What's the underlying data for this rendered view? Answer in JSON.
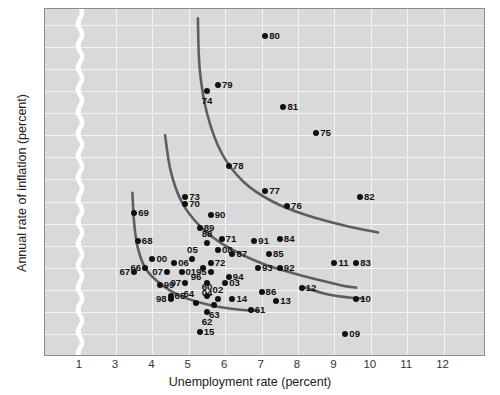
{
  "chart_data": {
    "type": "scatter",
    "title": "",
    "xlabel": "Unemployment rate (percent)",
    "ylabel": "Annual rate of inflation (percent)",
    "xlim": [
      0,
      12.6
    ],
    "ylim": [
      -1,
      14.6
    ],
    "xticks": [
      "1",
      "3",
      "4",
      "5",
      "6",
      "7",
      "8",
      "9",
      "10",
      "11",
      "12"
    ],
    "yticks": [
      "14",
      "13",
      "12",
      "11",
      "10",
      "9",
      "8",
      "7",
      "6",
      "5",
      "4",
      "3",
      "2",
      "1",
      "0",
      "-1"
    ],
    "axis_break": {
      "between": [
        1,
        3
      ],
      "style": "wavy-white-band"
    },
    "grid": true,
    "legend": "none",
    "plot_bgcolor": "#d9d9d9",
    "grid_color": "#f4f4f4",
    "point_color": "#111111",
    "curve_color": "#5e5e5e",
    "points": [
      {
        "label": "80",
        "x": 7.1,
        "y": 13.5,
        "lp": "lb-r"
      },
      {
        "label": "79",
        "x": 5.8,
        "y": 11.3,
        "lp": "lb-r"
      },
      {
        "label": "74",
        "x": 5.5,
        "y": 11.0,
        "lp": "lb-b"
      },
      {
        "label": "81",
        "x": 7.6,
        "y": 10.3,
        "lp": "lb-r"
      },
      {
        "label": "75",
        "x": 8.5,
        "y": 9.1,
        "lp": "lb-r"
      },
      {
        "label": "78",
        "x": 6.1,
        "y": 7.6,
        "lp": "lb-r"
      },
      {
        "label": "77",
        "x": 7.1,
        "y": 6.5,
        "lp": "lb-r"
      },
      {
        "label": "82",
        "x": 9.7,
        "y": 6.2,
        "lp": "lb-r"
      },
      {
        "label": "76",
        "x": 7.7,
        "y": 5.8,
        "lp": "lb-r"
      },
      {
        "label": "73",
        "x": 4.9,
        "y": 6.2,
        "lp": "lb-r"
      },
      {
        "label": "70",
        "x": 4.9,
        "y": 5.9,
        "lp": "lb-r"
      },
      {
        "label": "69",
        "x": 3.5,
        "y": 5.5,
        "lp": "lb-r"
      },
      {
        "label": "90",
        "x": 5.6,
        "y": 5.4,
        "lp": "lb-r"
      },
      {
        "label": "89",
        "x": 5.3,
        "y": 4.8,
        "lp": "lb-r"
      },
      {
        "label": "68",
        "x": 3.6,
        "y": 4.2,
        "lp": "lb-r"
      },
      {
        "label": "71",
        "x": 5.9,
        "y": 4.3,
        "lp": "lb-r"
      },
      {
        "label": "91",
        "x": 6.8,
        "y": 4.2,
        "lp": "lb-r"
      },
      {
        "label": "84",
        "x": 7.5,
        "y": 4.3,
        "lp": "lb-r"
      },
      {
        "label": "88",
        "x": 5.5,
        "y": 4.1,
        "lp": "lb-t"
      },
      {
        "label": "08",
        "x": 5.8,
        "y": 3.8,
        "lp": "lb-r"
      },
      {
        "label": "87",
        "x": 6.2,
        "y": 3.6,
        "lp": "lb-r"
      },
      {
        "label": "85",
        "x": 7.2,
        "y": 3.6,
        "lp": "lb-r"
      },
      {
        "label": "05",
        "x": 5.1,
        "y": 3.4,
        "lp": "lb-t"
      },
      {
        "label": "00",
        "x": 4.0,
        "y": 3.4,
        "lp": "lb-r"
      },
      {
        "label": "06",
        "x": 4.6,
        "y": 3.2,
        "lp": "lb-r"
      },
      {
        "label": "96",
        "x": 5.4,
        "y": 3.0,
        "lp": "lb-bl"
      },
      {
        "label": "72",
        "x": 5.6,
        "y": 3.2,
        "lp": "lb-r"
      },
      {
        "label": "93",
        "x": 6.9,
        "y": 3.0,
        "lp": "lb-r"
      },
      {
        "label": "92",
        "x": 7.5,
        "y": 3.0,
        "lp": "lb-r"
      },
      {
        "label": "66",
        "x": 3.8,
        "y": 3.0,
        "lp": "lb-l"
      },
      {
        "label": "67",
        "x": 3.5,
        "y": 2.8,
        "lp": "lb-l"
      },
      {
        "label": "07",
        "x": 4.4,
        "y": 2.8,
        "lp": "lb-l"
      },
      {
        "label": "01",
        "x": 4.8,
        "y": 2.8,
        "lp": "lb-r"
      },
      {
        "label": "95",
        "x": 5.6,
        "y": 2.8,
        "lp": "lb-l"
      },
      {
        "label": "11",
        "x": 9.0,
        "y": 3.2,
        "lp": "lb-r"
      },
      {
        "label": "83",
        "x": 9.6,
        "y": 3.2,
        "lp": "lb-r"
      },
      {
        "label": "94",
        "x": 6.1,
        "y": 2.6,
        "lp": "lb-r"
      },
      {
        "label": "99",
        "x": 4.2,
        "y": 2.2,
        "lp": "lb-r"
      },
      {
        "label": "97",
        "x": 4.9,
        "y": 2.3,
        "lp": "lb-l"
      },
      {
        "label": "04",
        "x": 5.5,
        "y": 2.3,
        "lp": "lb-b"
      },
      {
        "label": "03",
        "x": 6.0,
        "y": 2.3,
        "lp": "lb-r"
      },
      {
        "label": "86",
        "x": 7.0,
        "y": 1.9,
        "lp": "lb-r"
      },
      {
        "label": "12",
        "x": 8.1,
        "y": 2.1,
        "lp": "lb-r"
      },
      {
        "label": "10",
        "x": 9.6,
        "y": 1.6,
        "lp": "lb-r"
      },
      {
        "label": "98",
        "x": 4.5,
        "y": 1.6,
        "lp": "lb-l"
      },
      {
        "label": "65",
        "x": 4.5,
        "y": 1.7,
        "lp": "lb-r"
      },
      {
        "label": "64",
        "x": 5.2,
        "y": 1.4,
        "lp": "lb-tl"
      },
      {
        "label": "60",
        "x": 5.5,
        "y": 1.7,
        "lp": "lb-t"
      },
      {
        "label": "02",
        "x": 5.8,
        "y": 1.6,
        "lp": "lb-t"
      },
      {
        "label": "14",
        "x": 6.2,
        "y": 1.6,
        "lp": "lb-r"
      },
      {
        "label": "13",
        "x": 7.4,
        "y": 1.5,
        "lp": "lb-r"
      },
      {
        "label": "63",
        "x": 5.7,
        "y": 1.3,
        "lp": "lb-b"
      },
      {
        "label": "61",
        "x": 6.7,
        "y": 1.1,
        "lp": "lb-r"
      },
      {
        "label": "62",
        "x": 5.5,
        "y": 1.0,
        "lp": "lb-b"
      },
      {
        "label": "15",
        "x": 5.3,
        "y": 0.1,
        "lp": "lb-r"
      },
      {
        "label": "09",
        "x": 9.3,
        "y": 0.0,
        "lp": "lb-r"
      }
    ],
    "curves": [
      {
        "name": "phillips-curve-1970s",
        "points": [
          [
            5.25,
            14.3
          ],
          [
            5.3,
            12.0
          ],
          [
            5.5,
            10.0
          ],
          [
            5.9,
            8.2
          ],
          [
            6.5,
            6.9
          ],
          [
            7.3,
            6.0
          ],
          [
            8.2,
            5.4
          ],
          [
            9.3,
            4.9
          ],
          [
            10.2,
            4.6
          ]
        ]
      },
      {
        "name": "phillips-curve-mid",
        "points": [
          [
            4.35,
            9.0
          ],
          [
            4.5,
            7.4
          ],
          [
            4.8,
            6.0
          ],
          [
            5.3,
            4.9
          ],
          [
            6.0,
            4.0
          ],
          [
            7.0,
            3.2
          ],
          [
            8.2,
            2.6
          ],
          [
            9.2,
            2.2
          ],
          [
            9.6,
            2.1
          ]
        ]
      },
      {
        "name": "phillips-curve-1960s",
        "points": [
          [
            3.45,
            6.4
          ],
          [
            3.5,
            5.0
          ],
          [
            3.6,
            3.9
          ],
          [
            3.8,
            3.0
          ],
          [
            4.2,
            2.3
          ],
          [
            4.8,
            1.7
          ],
          [
            5.6,
            1.3
          ],
          [
            6.4,
            1.1
          ],
          [
            6.9,
            1.05
          ]
        ]
      },
      {
        "name": "phillips-curve-recent",
        "points": [
          [
            8.2,
            2.1
          ],
          [
            8.8,
            1.8
          ],
          [
            9.4,
            1.65
          ],
          [
            9.8,
            1.6
          ]
        ]
      }
    ]
  }
}
